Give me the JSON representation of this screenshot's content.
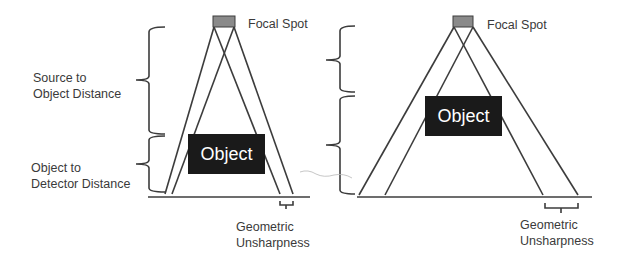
{
  "labels": {
    "focal_spot": "Focal Spot",
    "source_to_object_line1": "Source to",
    "source_to_object_line2": "Object Distance",
    "object_to_detector_line1": "Object to",
    "object_to_detector_line2": "Detector Distance",
    "geometric_line1": "Geometric",
    "geometric_line2": "Unsharpness",
    "object": "Object"
  },
  "left_diagram": {
    "focal_spot": "Focal Spot",
    "object": "Object",
    "geometric_unsharpness": [
      "Geometric",
      "Unsharpness"
    ],
    "source_to_object_distance": [
      "Source to",
      "Object Distance"
    ],
    "object_to_detector_distance": [
      "Object to",
      "Detector Distance"
    ]
  },
  "right_diagram": {
    "focal_spot": "Focal Spot",
    "object": "Object",
    "geometric_unsharpness": [
      "Geometric",
      "Unsharpness"
    ]
  },
  "colors": {
    "line": "#3c3c3c",
    "object_fill": "#1a1a1a",
    "object_text": "#ffffff",
    "focal_spot_fill": "#8a8a8a",
    "text": "#3a3a3a"
  }
}
